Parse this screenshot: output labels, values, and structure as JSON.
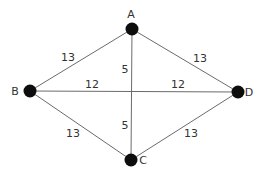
{
  "graph": {
    "nodes": [
      {
        "id": "A",
        "label": "A"
      },
      {
        "id": "B",
        "label": "B"
      },
      {
        "id": "C",
        "label": "C"
      },
      {
        "id": "D",
        "label": "D"
      }
    ],
    "edges": [
      {
        "from": "A",
        "to": "B",
        "weight": "13"
      },
      {
        "from": "A",
        "to": "D",
        "weight": "13"
      },
      {
        "from": "B",
        "to": "C",
        "weight": "13"
      },
      {
        "from": "C",
        "to": "D",
        "weight": "13"
      },
      {
        "from": "B",
        "to": "D",
        "weight": "12",
        "weight_repeat": "12"
      },
      {
        "from": "A",
        "to": "C",
        "weight": "5",
        "weight_repeat": "5"
      }
    ]
  }
}
